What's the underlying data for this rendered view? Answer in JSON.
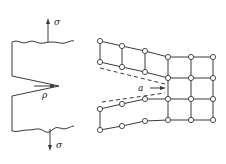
{
  "figure": {
    "left_panel": {
      "description": "Notched specimen under tensile stress",
      "labels": {
        "stress_top": "σ",
        "stress_bottom": "σ",
        "notch_radius": "ρ"
      }
    },
    "right_panel": {
      "description": "Lattice of atoms near a crack tip",
      "labels": {
        "lattice_spacing": "a"
      },
      "grid": {
        "columns_right": 3,
        "rows": 4
      }
    },
    "colors": {
      "line": "#3a3a3a",
      "background": "#ffffff"
    }
  }
}
